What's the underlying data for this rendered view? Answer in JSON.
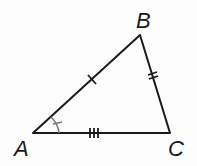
{
  "diagram": {
    "type": "triangle",
    "vertices": [
      {
        "label": "A",
        "x": 33,
        "y": 133
      },
      {
        "label": "B",
        "x": 140,
        "y": 35
      },
      {
        "label": "C",
        "x": 170,
        "y": 133
      }
    ],
    "sides": [
      {
        "name": "AB",
        "tick_marks": 1
      },
      {
        "name": "BC",
        "tick_marks": 2
      },
      {
        "name": "AC",
        "tick_marks": 3
      }
    ],
    "angle_marks": [
      {
        "vertex": "A",
        "tick_marks": 1
      }
    ],
    "colors": {
      "line": "#1a1a1a",
      "angle_mark": "#777777",
      "background": "#fdfdfd"
    }
  }
}
